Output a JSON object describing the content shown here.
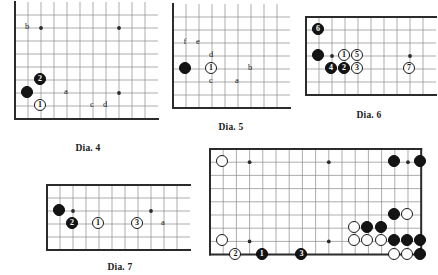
{
  "page": {
    "background": "#ffffff",
    "ink": "#1a1a1a",
    "grid_color": "#8a8a8a",
    "edge_color": "#2b2b2b",
    "black_stone_color": "#141414",
    "white_stone_color": "#fdfdfd"
  },
  "diagrams": [
    {
      "id": "dia-4",
      "caption": "Dia. 4",
      "x": 14,
      "y": 14,
      "cols": 11,
      "rows": 9,
      "cell": 13.0,
      "edges": [
        "left",
        "bottom"
      ],
      "star_points": [
        [
          2,
          1
        ],
        [
          8,
          1
        ],
        [
          8,
          6
        ]
      ],
      "caption_x": 14,
      "caption_y": 143,
      "caption_w": 148,
      "stones": [
        {
          "label": "",
          "color": "black",
          "col": 1,
          "row": 6,
          "type": "plain"
        },
        {
          "label": "2",
          "color": "black",
          "col": 2,
          "row": 5,
          "type": "numbered"
        },
        {
          "label": "1",
          "color": "white",
          "col": 2,
          "row": 7,
          "type": "numbered"
        }
      ],
      "markers": [
        {
          "label": "b",
          "col": 1,
          "row": 1
        },
        {
          "label": "a",
          "col": 4,
          "row": 6
        },
        {
          "label": "c",
          "col": 6,
          "row": 7
        },
        {
          "label": "d",
          "col": 7,
          "row": 7
        }
      ]
    },
    {
      "id": "dia-5",
      "caption": "Dia. 5",
      "x": 172,
      "y": 16,
      "cols": 9,
      "rows": 8,
      "cell": 13.0,
      "edges": [
        "left",
        "bottom"
      ],
      "star_points": [],
      "caption_x": 172,
      "caption_y": 122,
      "caption_w": 118,
      "stones": [
        {
          "label": "",
          "color": "black",
          "col": 1,
          "row": 4,
          "type": "plain"
        },
        {
          "label": "1",
          "color": "white",
          "col": 3,
          "row": 4,
          "type": "numbered"
        }
      ],
      "markers": [
        {
          "label": "f",
          "col": 1,
          "row": 2
        },
        {
          "label": "e",
          "col": 2,
          "row": 2
        },
        {
          "label": "d",
          "col": 3,
          "row": 3
        },
        {
          "label": "c",
          "col": 3,
          "row": 5
        },
        {
          "label": "a",
          "col": 5,
          "row": 5
        },
        {
          "label": "b",
          "col": 6,
          "row": 4
        }
      ]
    },
    {
      "id": "dia-6",
      "caption": "Dia. 6",
      "x": 305,
      "y": 16,
      "cols": 10,
      "rows": 7,
      "cell": 13.0,
      "edges": [
        "left",
        "top",
        "bottom"
      ],
      "star_points": [
        [
          2,
          3
        ],
        [
          8,
          3
        ]
      ],
      "caption_x": 305,
      "caption_y": 110,
      "caption_w": 128,
      "stones": [
        {
          "label": "",
          "color": "black",
          "col": 1,
          "row": 3,
          "type": "plain"
        },
        {
          "label": "6",
          "color": "black",
          "col": 1,
          "row": 1,
          "type": "numbered"
        },
        {
          "label": "4",
          "color": "black",
          "col": 2,
          "row": 4,
          "type": "numbered"
        },
        {
          "label": "2",
          "color": "black",
          "col": 3,
          "row": 4,
          "type": "numbered"
        },
        {
          "label": "1",
          "color": "white",
          "col": 3,
          "row": 3,
          "type": "numbered"
        },
        {
          "label": "5",
          "color": "white",
          "col": 4,
          "row": 3,
          "type": "numbered"
        },
        {
          "label": "3",
          "color": "white",
          "col": 4,
          "row": 4,
          "type": "numbered"
        },
        {
          "label": "7",
          "color": "white",
          "col": 8,
          "row": 4,
          "type": "numbered"
        }
      ],
      "markers": []
    },
    {
      "id": "dia-7",
      "caption": "Dia. 7",
      "x": 46,
      "y": 184,
      "cols": 11,
      "rows": 6,
      "cell": 13.0,
      "edges": [
        "left",
        "top",
        "bottom"
      ],
      "star_points": [
        [
          2,
          2
        ],
        [
          8,
          2
        ]
      ],
      "caption_x": 46,
      "caption_y": 262,
      "caption_w": 148,
      "stones": [
        {
          "label": "",
          "color": "black",
          "col": 1,
          "row": 2,
          "type": "plain"
        },
        {
          "label": "2",
          "color": "black",
          "col": 2,
          "row": 3,
          "type": "numbered"
        },
        {
          "label": "1",
          "color": "white",
          "col": 4,
          "row": 3,
          "type": "numbered"
        },
        {
          "label": "3",
          "color": "white",
          "col": 7,
          "row": 3,
          "type": "numbered"
        }
      ],
      "markers": [
        {
          "label": "a",
          "col": 9,
          "row": 3
        }
      ]
    },
    {
      "id": "dia-main",
      "caption": "",
      "x": 209,
      "y": 148,
      "cols": 17,
      "rows": 9,
      "cell": 13.2,
      "edges": [
        "left",
        "top",
        "right",
        "bottom"
      ],
      "star_points": [
        [
          3,
          1
        ],
        [
          9,
          1
        ],
        [
          15,
          1
        ],
        [
          3,
          7
        ],
        [
          9,
          7
        ],
        [
          15,
          7
        ]
      ],
      "caption_x": 0,
      "caption_y": 0,
      "caption_w": 0,
      "stones": [
        {
          "label": "",
          "color": "white",
          "col": 1,
          "row": 1,
          "type": "plain"
        },
        {
          "label": "",
          "color": "black",
          "col": 14,
          "row": 1,
          "type": "plain"
        },
        {
          "label": "",
          "color": "black",
          "col": 16,
          "row": 1,
          "type": "plain"
        },
        {
          "label": "",
          "color": "black",
          "col": 14,
          "row": 5,
          "type": "plain"
        },
        {
          "label": "",
          "color": "white",
          "col": 15,
          "row": 5,
          "type": "plain"
        },
        {
          "label": "",
          "color": "white",
          "col": 11,
          "row": 6,
          "type": "plain"
        },
        {
          "label": "",
          "color": "black",
          "col": 12,
          "row": 6,
          "type": "plain"
        },
        {
          "label": "",
          "color": "black",
          "col": 13,
          "row": 6,
          "type": "plain"
        },
        {
          "label": "",
          "color": "white",
          "col": 11,
          "row": 7,
          "type": "plain"
        },
        {
          "label": "",
          "color": "white",
          "col": 12,
          "row": 7,
          "type": "plain"
        },
        {
          "label": "",
          "color": "white",
          "col": 13,
          "row": 7,
          "type": "plain"
        },
        {
          "label": "",
          "color": "black",
          "col": 14,
          "row": 7,
          "type": "plain"
        },
        {
          "label": "",
          "color": "black",
          "col": 15,
          "row": 7,
          "type": "plain"
        },
        {
          "label": "",
          "color": "black",
          "col": 16,
          "row": 7,
          "type": "plain"
        },
        {
          "label": "",
          "color": "white",
          "col": 14,
          "row": 8,
          "type": "plain"
        },
        {
          "label": "",
          "color": "white",
          "col": 15,
          "row": 8,
          "type": "plain"
        },
        {
          "label": "",
          "color": "black",
          "col": 16,
          "row": 8,
          "type": "plain"
        },
        {
          "label": "",
          "color": "white",
          "col": 1,
          "row": 7,
          "type": "plain"
        },
        {
          "label": "2",
          "color": "white",
          "col": 2,
          "row": 8,
          "type": "numbered"
        },
        {
          "label": "1",
          "color": "black",
          "col": 4,
          "row": 8,
          "type": "numbered"
        },
        {
          "label": "3",
          "color": "black",
          "col": 7,
          "row": 8,
          "type": "numbered"
        }
      ],
      "markers": []
    }
  ]
}
